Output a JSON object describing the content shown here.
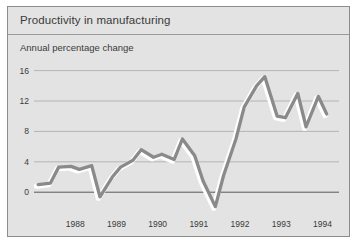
{
  "figure": {
    "title": "Productivity in manufacturing",
    "subtitle": "Annual percentage change"
  },
  "colors": {
    "background": "#e3e3e3",
    "border": "#8c8c8c",
    "line": "#8a8a8a",
    "line_highlight": "#ffffff",
    "gridline": "#a8a8a8",
    "axis": "#4a4a4a",
    "text": "#3a3a3a"
  },
  "chart_data": {
    "type": "line",
    "title": "Productivity in manufacturing",
    "subtitle": "Annual percentage change",
    "xlabel": "",
    "ylabel": "Annual percentage change",
    "ylim": [
      -3,
      17
    ],
    "xlim": [
      1987.5,
      1994.9
    ],
    "yticks": [
      0,
      4,
      8,
      12,
      16
    ],
    "ytick_labels": [
      "0",
      "4",
      "8",
      "12",
      "16"
    ],
    "xticks": [
      1988,
      1989,
      1990,
      1991,
      1992,
      1993,
      1994,
      1995
    ],
    "xtick_labels": [
      "1988",
      "1989",
      "1990",
      "1991",
      "1992",
      "1993",
      "1994"
    ],
    "grid": true,
    "legend": null,
    "zero_line": 0,
    "series": [
      {
        "name": "Productivity in manufacturing",
        "x": [
          1987.6,
          1987.9,
          1988.1,
          1988.4,
          1988.6,
          1988.9,
          1989.1,
          1989.4,
          1989.6,
          1989.9,
          1990.1,
          1990.4,
          1990.6,
          1990.9,
          1991.1,
          1991.4,
          1991.6,
          1991.9,
          1992.1,
          1992.4,
          1992.6,
          1992.9,
          1993.1,
          1993.4,
          1993.6,
          1993.9,
          1994.1,
          1994.4,
          1994.6
        ],
        "values": [
          1.0,
          1.2,
          3.3,
          3.4,
          3.0,
          3.5,
          -0.6,
          2.0,
          3.3,
          4.2,
          5.6,
          4.6,
          5.0,
          4.3,
          7.0,
          4.8,
          1.5,
          -1.9,
          2.2,
          7.0,
          11.2,
          14.0,
          15.2,
          10.0,
          9.8,
          13.0,
          8.6,
          12.6,
          10.3
        ]
      }
    ]
  }
}
